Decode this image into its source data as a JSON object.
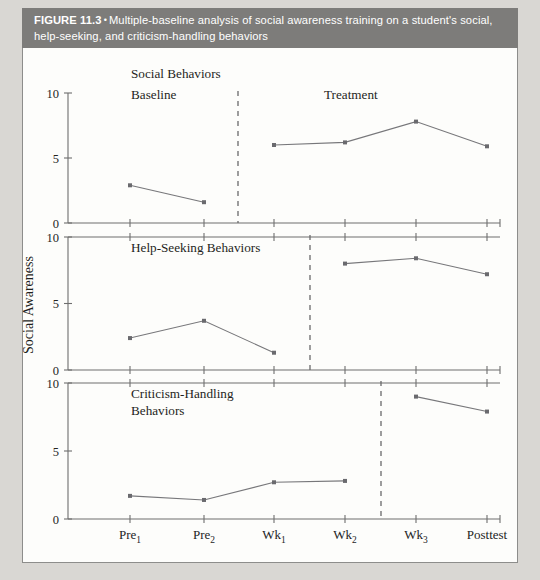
{
  "caption": {
    "figure_number": "FIGURE 11.3",
    "bullet": "•",
    "text": "Multiple-baseline analysis of social awareness training on a student's social, help-seeking, and criticism-handling behaviors"
  },
  "axis": {
    "y_label": "Social Awareness",
    "y_ticks": [
      "0",
      "5",
      "10"
    ],
    "x_categories": [
      "Pre",
      "Pre",
      "Wk",
      "Wk",
      "Wk",
      "Posttest"
    ],
    "x_labels": [
      {
        "base": "Pre",
        "sub": "1"
      },
      {
        "base": "Pre",
        "sub": "2"
      },
      {
        "base": "Wk",
        "sub": "1"
      },
      {
        "base": "Wk",
        "sub": "2"
      },
      {
        "base": "Wk",
        "sub": "3"
      },
      {
        "base": "Posttest",
        "sub": ""
      }
    ]
  },
  "phase_labels": {
    "baseline": "Baseline",
    "treatment": "Treatment"
  },
  "panel_titles": {
    "panel1": "Social Behaviors",
    "panel2": "Help-Seeking Behaviors",
    "panel3_line1": "Criticism-Handling",
    "panel3_line2": "Behaviors"
  },
  "colors": {
    "band": "#7d7c7a",
    "plate": "#fdfdfb",
    "page": "#d9d7d3",
    "line": "#77777a",
    "marker": "#6a6a6e",
    "axis": "#6e6e6e"
  },
  "chart_data": {
    "type": "line",
    "title": "Multiple-baseline analysis of social awareness training on a student's social, help-seeking, and criticism-handling behaviors",
    "xlabel": "",
    "ylabel": "Social Awareness",
    "ylim": [
      0,
      10
    ],
    "yticks": [
      0,
      5,
      10
    ],
    "grid": false,
    "legend": "none",
    "x": [
      "Pre1",
      "Pre2",
      "Wk1",
      "Wk2",
      "Wk3",
      "Posttest"
    ],
    "panels": [
      {
        "name": "Social Behaviors",
        "phase_change_after": "Pre2",
        "phase_labels": [
          "Baseline",
          "Treatment"
        ],
        "series": [
          {
            "name": "Baseline",
            "x": [
              "Pre1",
              "Pre2"
            ],
            "values": [
              2.9,
              1.6
            ]
          },
          {
            "name": "Treatment",
            "x": [
              "Wk1",
              "Wk2",
              "Wk3",
              "Posttest"
            ],
            "values": [
              6.0,
              6.2,
              7.8,
              5.9
            ]
          }
        ]
      },
      {
        "name": "Help-Seeking Behaviors",
        "phase_change_after": "Wk1",
        "phase_labels": [
          "Baseline",
          "Treatment"
        ],
        "series": [
          {
            "name": "Baseline",
            "x": [
              "Pre1",
              "Pre2",
              "Wk1"
            ],
            "values": [
              2.4,
              3.7,
              1.3
            ]
          },
          {
            "name": "Treatment",
            "x": [
              "Wk2",
              "Wk3",
              "Posttest"
            ],
            "values": [
              8.0,
              8.4,
              7.2
            ]
          }
        ]
      },
      {
        "name": "Criticism-Handling Behaviors",
        "phase_change_after": "Wk2",
        "phase_labels": [
          "Baseline",
          "Treatment"
        ],
        "series": [
          {
            "name": "Baseline",
            "x": [
              "Pre1",
              "Pre2",
              "Wk1",
              "Wk2"
            ],
            "values": [
              1.7,
              1.4,
              2.7,
              2.8
            ]
          },
          {
            "name": "Treatment",
            "x": [
              "Wk3",
              "Posttest"
            ],
            "values": [
              9.0,
              7.9
            ]
          }
        ]
      }
    ]
  }
}
